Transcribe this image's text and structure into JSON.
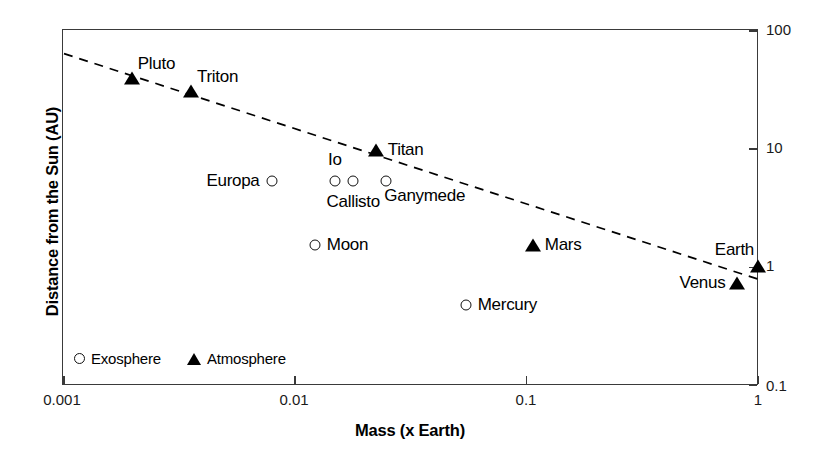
{
  "chart_data": {
    "type": "scatter",
    "title": "",
    "xlabel": "Mass (x Earth)",
    "ylabel": "Distance from the Sun (AU)",
    "xscale": "log",
    "yscale": "log",
    "xlim": [
      0.001,
      1
    ],
    "ylim": [
      0.1,
      100
    ],
    "xticks": [
      "0.001",
      "0.01",
      "0.1",
      "1"
    ],
    "xtick_values": [
      0.001,
      0.01,
      0.1,
      1
    ],
    "yticks": [
      "0.1",
      "1",
      "10",
      "100"
    ],
    "ytick_values": [
      0.1,
      1,
      10,
      100
    ],
    "grid": false,
    "y_axis_position": "right",
    "legend_position": "bottom-left",
    "legend": [
      {
        "label": "Exosphere",
        "marker": "open-circle"
      },
      {
        "label": "Atmosphere",
        "marker": "filled-triangle"
      }
    ],
    "series": [
      {
        "name": "Exosphere",
        "marker": "open-circle",
        "points": [
          {
            "label": "Europa",
            "x": 0.008,
            "y": 5.2,
            "label_pos": "left"
          },
          {
            "label": "Io",
            "x": 0.015,
            "y": 5.2,
            "label_pos": "above"
          },
          {
            "label": "Callisto",
            "x": 0.018,
            "y": 5.2,
            "label_pos": "below"
          },
          {
            "label": "Ganymede",
            "x": 0.025,
            "y": 5.2,
            "label_pos": "below-right"
          },
          {
            "label": "Moon",
            "x": 0.0123,
            "y": 1.5,
            "label_pos": "right"
          },
          {
            "label": "Mercury",
            "x": 0.055,
            "y": 0.47,
            "label_pos": "right"
          }
        ]
      },
      {
        "name": "Atmosphere",
        "marker": "filled-triangle",
        "points": [
          {
            "label": "Pluto",
            "x": 0.002,
            "y": 39.0,
            "label_pos": "above-right"
          },
          {
            "label": "Triton",
            "x": 0.0036,
            "y": 30.0,
            "label_pos": "above-right"
          },
          {
            "label": "Titan",
            "x": 0.0225,
            "y": 9.5,
            "label_pos": "right"
          },
          {
            "label": "Mars",
            "x": 0.107,
            "y": 1.52,
            "label_pos": "right"
          },
          {
            "label": "Earth",
            "x": 1.0,
            "y": 1.0,
            "label_pos": "above-left"
          },
          {
            "label": "Venus",
            "x": 0.815,
            "y": 0.72,
            "label_pos": "left"
          }
        ]
      }
    ],
    "trendline": {
      "style": "dashed",
      "description": "Decreasing log-log trend from upper left to lower right",
      "start": {
        "x": 0.00102,
        "y": 62.0
      },
      "end": {
        "x": 1.0,
        "y": 0.78
      }
    }
  }
}
